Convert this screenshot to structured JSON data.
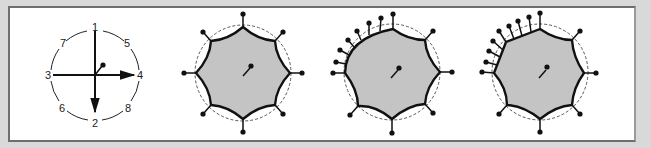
{
  "figure": {
    "colors": {
      "background": "#d9d9d9",
      "panel": "#ffffff",
      "fill": "#c4c4c4",
      "ink": "#111111",
      "dashed": "#555555"
    },
    "panels": [
      {
        "id": "compass",
        "center": [
          95,
          75
        ],
        "radius": 45,
        "labels": [
          {
            "text": "1",
            "pos": "top"
          },
          {
            "text": "2",
            "pos": "bottom"
          },
          {
            "text": "3",
            "pos": "left"
          },
          {
            "text": "4",
            "pos": "right"
          },
          {
            "text": "5",
            "pos": "upper-right"
          },
          {
            "text": "6",
            "pos": "lower-left"
          },
          {
            "text": "7",
            "pos": "upper-left"
          },
          {
            "text": "8",
            "pos": "lower-right"
          }
        ]
      },
      {
        "id": "octagon-concave-8-pins",
        "center": [
          243,
          73
        ],
        "pins": 8
      },
      {
        "id": "octagon-bulged-quadrant-pins",
        "center": [
          392,
          72
        ],
        "pins": 14
      },
      {
        "id": "octagon-straight-quadrant-pins",
        "center": [
          540,
          72
        ],
        "pins": 15
      }
    ]
  }
}
